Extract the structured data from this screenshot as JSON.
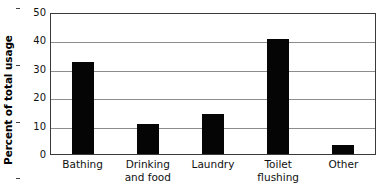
{
  "chart_data": {
    "type": "bar",
    "title": "",
    "xlabel": "",
    "ylabel": "Percent of total usage",
    "categories": [
      "Bathing",
      "Drinking and food",
      "Laundry",
      "Toilet flushing",
      "Other"
    ],
    "category_lines": [
      [
        "Bathing"
      ],
      [
        "Drinking",
        "and food"
      ],
      [
        "Laundry"
      ],
      [
        "Toilet",
        "flushing"
      ],
      [
        "Other"
      ]
    ],
    "values": [
      32.5,
      10.5,
      14,
      40.5,
      3
    ],
    "ylim": [
      0,
      50
    ],
    "yticks": [
      0,
      10,
      20,
      30,
      40,
      50
    ],
    "ytick_labels": [
      "0",
      "10",
      "20",
      "30",
      "40",
      "50"
    ],
    "grid": true,
    "grid_axis": "y",
    "legend": false,
    "bar_color": "#050505",
    "grid_color": "#8d8d8d",
    "frame_color": "#3a3a3a",
    "background_color": "#ffffff"
  }
}
